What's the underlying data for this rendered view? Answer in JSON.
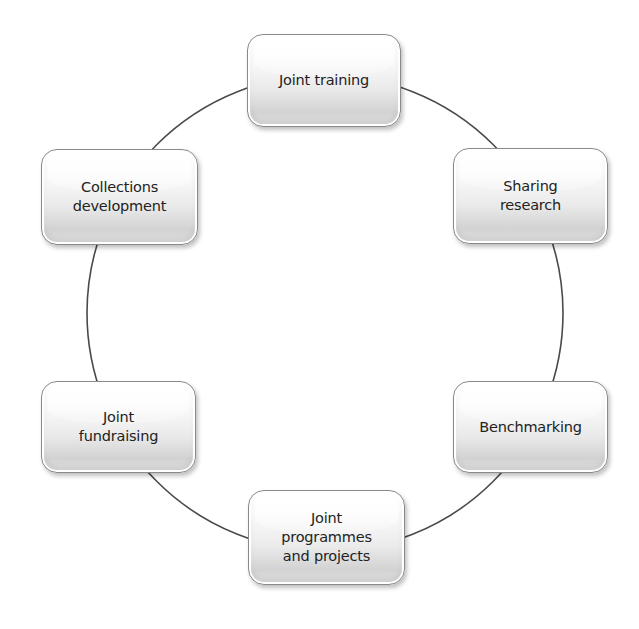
{
  "diagram": {
    "type": "cycle",
    "ring": {
      "cx": 325,
      "cy": 313,
      "r": 238,
      "stroke": "#4a4a4a"
    },
    "nodes": [
      {
        "id": "joint-training",
        "label": "Joint training",
        "x": 247,
        "y": 34,
        "w": 154,
        "h": 93
      },
      {
        "id": "sharing-research",
        "label": "Sharing\nresearch",
        "x": 453,
        "y": 148,
        "w": 155,
        "h": 96
      },
      {
        "id": "benchmarking",
        "label": "Benchmarking",
        "x": 453,
        "y": 381,
        "w": 155,
        "h": 92
      },
      {
        "id": "joint-programmes",
        "label": "Joint\nprogrammes\nand projects",
        "x": 248,
        "y": 490,
        "w": 157,
        "h": 95
      },
      {
        "id": "joint-fundraising",
        "label": "Joint\nfundraising",
        "x": 41,
        "y": 381,
        "w": 155,
        "h": 92
      },
      {
        "id": "collections-development",
        "label": "Collections\ndevelopment",
        "x": 41,
        "y": 149,
        "w": 157,
        "h": 96
      }
    ]
  }
}
